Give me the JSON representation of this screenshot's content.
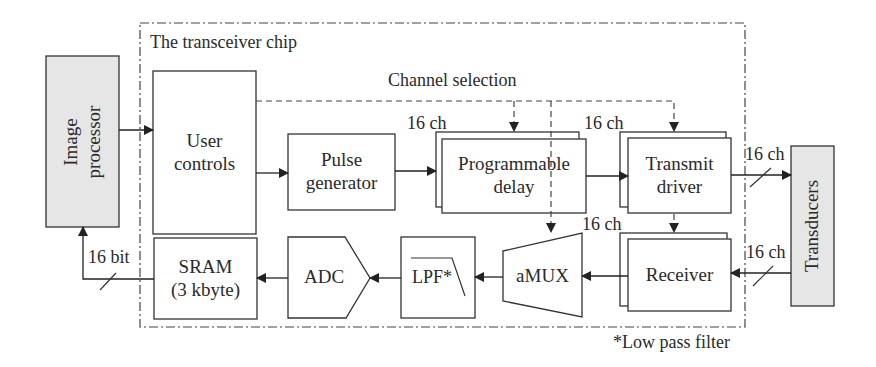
{
  "diagram": {
    "type": "block-diagram",
    "chip": {
      "label": "The transceiver chip"
    },
    "channel_selection": {
      "label": "Channel selection"
    },
    "blocks": {
      "image_processor": {
        "label_line1": "Image",
        "label_line2": "processor"
      },
      "user_controls": {
        "label_line1": "User",
        "label_line2": "controls"
      },
      "pulse_generator": {
        "label_line1": "Pulse",
        "label_line2": "generator"
      },
      "programmable_delay": {
        "label_line1": "Programmable",
        "label_line2": "delay"
      },
      "transmit_driver": {
        "label_line1": "Transmit",
        "label_line2": "driver"
      },
      "transducers": {
        "label": "Transducers"
      },
      "receiver": {
        "label": "Receiver"
      },
      "amux": {
        "label": "aMUX"
      },
      "lpf": {
        "label": "LPF*"
      },
      "adc": {
        "label": "ADC"
      },
      "sram": {
        "label_line1": "SRAM",
        "label_line2": "(3 kbyte)"
      }
    },
    "bus_labels": {
      "delay_in": "16 ch",
      "driver_in": "16 ch",
      "driver_out": "16 ch",
      "amux_in": "16 ch",
      "receiver_in": "16 ch",
      "sram_out": "16 bit"
    },
    "footnote": "*Low pass filter",
    "colors": {
      "stroke": "#333333",
      "shaded_fill": "#e6e6e6",
      "background": "#ffffff"
    }
  }
}
